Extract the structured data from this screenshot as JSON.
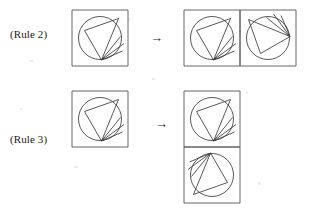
{
  "diagram": {
    "background_color": "#ffffff",
    "stroke_color": "#3a3a3a",
    "frame_color": "#555555",
    "arrow_glyph": "→",
    "rows": [
      {
        "id": "rule-2",
        "label": "(Rule 2)",
        "arrow": "→",
        "source": {
          "name": "motif-tile",
          "tiles": 1,
          "columns": 1,
          "rows": 1,
          "cell_size": 56,
          "rotations": [
            0
          ]
        },
        "result": {
          "name": "horizontal-pair",
          "tiles": 2,
          "columns": 2,
          "rows": 1,
          "cell_size": 56,
          "rotations": [
            0,
            270
          ],
          "description": "original tile plus copy rotated to the right"
        }
      },
      {
        "id": "rule-3",
        "label": "(Rule 3)",
        "arrow": "→",
        "source": {
          "name": "motif-tile",
          "tiles": 1,
          "columns": 1,
          "rows": 1,
          "cell_size": 56,
          "rotations": [
            0
          ]
        },
        "result": {
          "name": "vertical-pair",
          "tiles": 2,
          "columns": 1,
          "rows": 2,
          "cell_size": 56,
          "rotations": [
            0,
            180
          ],
          "description": "original tile plus copy rotated one half turn below"
        }
      }
    ],
    "motif": {
      "name": "square-circle-triangle-fan",
      "elements": [
        "square-frame",
        "inscribed-circle",
        "triangle",
        "fan-lines"
      ],
      "cell_size": 56,
      "circle": {
        "cx": 28,
        "cy": 28,
        "r": 21.5
      },
      "triangle": [
        [
          12.5,
          20.5
        ],
        [
          46.5,
          8.5
        ],
        [
          29.5,
          50.0
        ]
      ],
      "fan": {
        "origin": [
          29.5,
          50.0
        ],
        "endpoints": [
          [
            48.5,
            26.5
          ],
          [
            52.0,
            33.5
          ],
          [
            50.5,
            41.0
          ]
        ]
      }
    }
  }
}
